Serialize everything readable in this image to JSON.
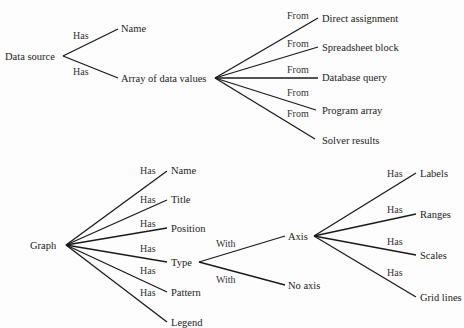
{
  "diagrams": [
    {
      "id": "data-source-tree",
      "root": "Data source",
      "children": [
        {
          "relation": "Has",
          "label": "Name"
        },
        {
          "relation": "Has",
          "label": "Array of data values",
          "children": [
            {
              "relation": "From",
              "label": "Direct assignment"
            },
            {
              "relation": "From",
              "label": "Spreadsheet block"
            },
            {
              "relation": "From",
              "label": "Database query"
            },
            {
              "relation": "From",
              "label": "Program array"
            },
            {
              "relation": "From",
              "label": "Solver results"
            }
          ]
        }
      ]
    },
    {
      "id": "graph-tree",
      "root": "Graph",
      "children": [
        {
          "relation": "Has",
          "label": "Name"
        },
        {
          "relation": "Has",
          "label": "Title"
        },
        {
          "relation": "Has",
          "label": "Position"
        },
        {
          "relation": "Has",
          "label": "Type",
          "children": [
            {
              "relation": "With",
              "label": "Axis",
              "children": [
                {
                  "relation": "Has",
                  "label": "Labels"
                },
                {
                  "relation": "Has",
                  "label": "Ranges"
                },
                {
                  "relation": "Has",
                  "label": "Scales"
                },
                {
                  "relation": "Has",
                  "label": "Grid lines"
                }
              ]
            },
            {
              "relation": "With",
              "label": "No axis"
            }
          ]
        },
        {
          "relation": "Has",
          "label": "Pattern"
        },
        {
          "relation": "Has",
          "label": "Legend"
        }
      ]
    }
  ],
  "colors": {
    "ink": "#1a1a1a",
    "background": "#fdfdfd"
  }
}
